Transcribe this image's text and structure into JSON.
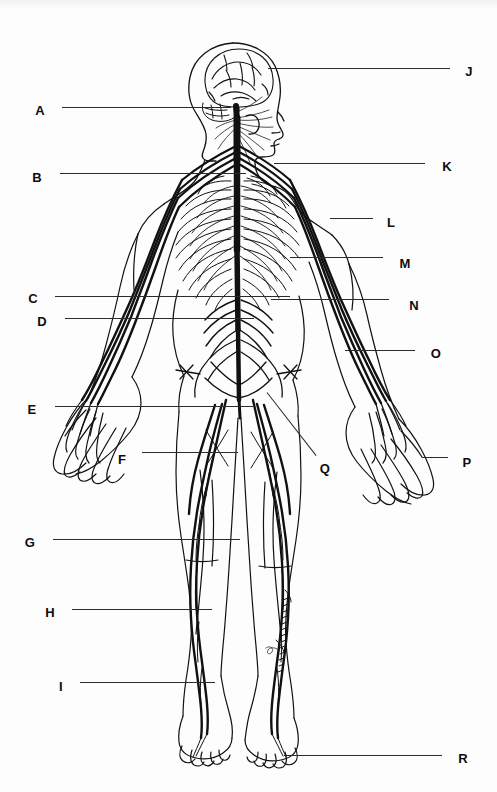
{
  "document": {
    "type": "anatomy-worksheet",
    "subject": "Human nervous system",
    "view": "posterior (back) full-body outline",
    "background_color": "#fdfdfd",
    "ink_color": "#111111",
    "leader_color": "#2b2b2b"
  },
  "labels": [
    {
      "id": "A",
      "text": "A",
      "side": "left",
      "x": 40,
      "y": 110,
      "line_x1": 62,
      "line_y1": 107,
      "line_x2": 231,
      "line_y2": 107
    },
    {
      "id": "B",
      "text": "B",
      "side": "left",
      "x": 37,
      "y": 177,
      "line_x1": 60,
      "line_y1": 173,
      "line_x2": 246,
      "line_y2": 173
    },
    {
      "id": "C",
      "text": "C",
      "side": "left",
      "x": 33,
      "y": 298,
      "line_x1": 55,
      "line_y1": 296,
      "line_x2": 290,
      "line_y2": 296
    },
    {
      "id": "D",
      "text": "D",
      "side": "left",
      "x": 42,
      "y": 321,
      "line_x1": 65,
      "line_y1": 318,
      "line_x2": 254,
      "line_y2": 318
    },
    {
      "id": "E",
      "text": "E",
      "side": "left",
      "x": 32,
      "y": 409,
      "line_x1": 55,
      "line_y1": 406,
      "line_x2": 253,
      "line_y2": 406
    },
    {
      "id": "F",
      "text": "F",
      "side": "left",
      "x": 122,
      "y": 459,
      "line_x1": 142,
      "line_y1": 452,
      "line_x2": 238,
      "line_y2": 452
    },
    {
      "id": "G",
      "text": "G",
      "side": "left",
      "x": 30,
      "y": 542,
      "line_x1": 53,
      "line_y1": 539,
      "line_x2": 240,
      "line_y2": 539
    },
    {
      "id": "H",
      "text": "H",
      "side": "left",
      "x": 50,
      "y": 612,
      "line_x1": 72,
      "line_y1": 609,
      "line_x2": 212,
      "line_y2": 609
    },
    {
      "id": "I",
      "text": "I",
      "side": "left",
      "x": 61,
      "y": 686,
      "line_x1": 80,
      "line_y1": 682,
      "line_x2": 215,
      "line_y2": 682
    },
    {
      "id": "J",
      "text": "J",
      "side": "right",
      "x": 469,
      "y": 71,
      "line_x1": 268,
      "line_y1": 68,
      "line_x2": 450,
      "line_y2": 68
    },
    {
      "id": "K",
      "text": "K",
      "side": "right",
      "x": 447,
      "y": 166,
      "line_x1": 274,
      "line_y1": 163,
      "line_x2": 425,
      "line_y2": 163
    },
    {
      "id": "L",
      "text": "L",
      "side": "right",
      "x": 391,
      "y": 222,
      "line_x1": 330,
      "line_y1": 218,
      "line_x2": 373,
      "line_y2": 218
    },
    {
      "id": "M",
      "text": "M",
      "side": "right",
      "x": 405,
      "y": 263,
      "line_x1": 290,
      "line_y1": 257,
      "line_x2": 383,
      "line_y2": 257
    },
    {
      "id": "N",
      "text": "N",
      "side": "right",
      "x": 414,
      "y": 305,
      "line_x1": 271,
      "line_y1": 299,
      "line_x2": 389,
      "line_y2": 299
    },
    {
      "id": "O",
      "text": "O",
      "side": "right",
      "x": 436,
      "y": 353,
      "line_x1": 345,
      "line_y1": 350,
      "line_x2": 415,
      "line_y2": 350
    },
    {
      "id": "P",
      "text": "P",
      "side": "right",
      "x": 467,
      "y": 462,
      "line_x1": 422,
      "line_y1": 457,
      "line_x2": 448,
      "line_y2": 457
    },
    {
      "id": "Q",
      "text": "Q",
      "side": "right",
      "x": 325,
      "y": 468,
      "line_x1": 267,
      "line_y1": 392,
      "line_x2": 316,
      "line_y2": 455
    },
    {
      "id": "R",
      "text": "R",
      "side": "right",
      "x": 463,
      "y": 758,
      "line_x1": 284,
      "line_y1": 755,
      "line_x2": 442,
      "line_y2": 755
    }
  ],
  "figure": {
    "name": "full-body-nervous-system-outline",
    "parts": [
      "brain",
      "head-profile",
      "facial-nerves",
      "cervical-plexus",
      "spinal-cord",
      "rib-cage",
      "intercostal-nerves",
      "brachial-plexus",
      "arm-nerves",
      "hand-nerves",
      "lumbar-plexus",
      "sacral-plexus",
      "sciatic-nerve",
      "leg-nerves",
      "foot-outline"
    ]
  }
}
